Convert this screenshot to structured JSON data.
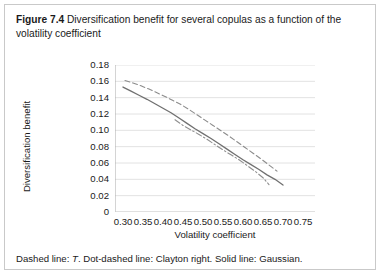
{
  "figure": {
    "label": "Figure 7.4",
    "caption": "Diversification benefit for several copulas as a function of the volatility coefficient",
    "note_prefix": "Dashed line: ",
    "note_italic": "T",
    "note_suffix": ". Dot-dashed line: Clayton right. Solid line: Gaussian."
  },
  "chart_data": {
    "type": "line",
    "title": "",
    "xlabel": "Volatility coefficient",
    "ylabel": "Diversification benefit",
    "xlim": [
      0.28,
      0.78
    ],
    "ylim": [
      0,
      0.18
    ],
    "grid": true,
    "legend": "none",
    "x_ticks": [
      "0.30",
      "0.35",
      "0.40",
      "0.45",
      "0.50",
      "0.55",
      "0.60",
      "0.65",
      "0.70",
      "0.75"
    ],
    "x_tick_values": [
      0.3,
      0.35,
      0.4,
      0.45,
      0.5,
      0.55,
      0.6,
      0.65,
      0.7,
      0.75
    ],
    "y_ticks": [
      "0",
      "0.02",
      "0.04",
      "0.06",
      "0.08",
      "0.10",
      "0.12",
      "0.14",
      "0.16",
      "0.18"
    ],
    "y_tick_values": [
      0,
      0.02,
      0.04,
      0.06,
      0.08,
      0.1,
      0.12,
      0.14,
      0.16,
      0.18
    ],
    "series": [
      {
        "name": "T",
        "style": "dashed",
        "color": "#8c8c8c",
        "x": [
          0.305,
          0.325,
          0.345,
          0.365,
          0.385,
          0.405,
          0.425,
          0.445,
          0.465,
          0.485,
          0.505,
          0.525,
          0.545,
          0.565,
          0.585,
          0.605,
          0.625,
          0.645,
          0.665,
          0.685
        ],
        "y": [
          0.161,
          0.158,
          0.1545,
          0.1505,
          0.146,
          0.1415,
          0.1365,
          0.1315,
          0.1255,
          0.119,
          0.1125,
          0.106,
          0.0995,
          0.093,
          0.086,
          0.079,
          0.072,
          0.065,
          0.0575,
          0.05
        ]
      },
      {
        "name": "Gaussian",
        "style": "solid",
        "color": "#707070",
        "x": [
          0.3,
          0.32,
          0.34,
          0.36,
          0.38,
          0.4,
          0.42,
          0.44,
          0.46,
          0.48,
          0.5,
          0.52,
          0.54,
          0.56,
          0.58,
          0.6,
          0.62,
          0.64,
          0.66,
          0.68,
          0.7
        ],
        "y": [
          0.153,
          0.148,
          0.143,
          0.138,
          0.1325,
          0.127,
          0.1215,
          0.115,
          0.1085,
          0.102,
          0.096,
          0.09,
          0.0835,
          0.077,
          0.0705,
          0.064,
          0.058,
          0.052,
          0.0455,
          0.04,
          0.033
        ]
      },
      {
        "name": "Clayton right",
        "style": "dotdash",
        "color": "#8f8f8f",
        "x": [
          0.43,
          0.45,
          0.47,
          0.49,
          0.51,
          0.53,
          0.55,
          0.57,
          0.59,
          0.61,
          0.63,
          0.65,
          0.665
        ],
        "y": [
          0.113,
          0.106,
          0.1005,
          0.095,
          0.089,
          0.0825,
          0.076,
          0.07,
          0.064,
          0.057,
          0.05,
          0.042,
          0.0335
        ]
      }
    ]
  }
}
